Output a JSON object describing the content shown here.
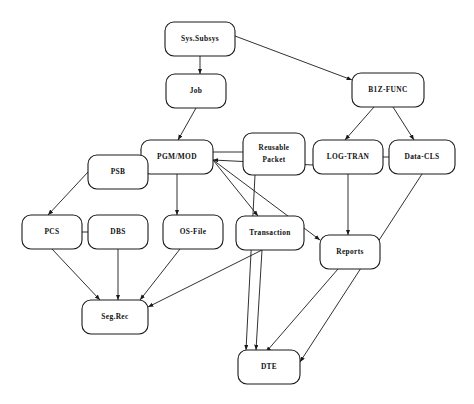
{
  "diagram": {
    "type": "node-link-flow",
    "background_color": "#ffffff",
    "stroke_color": "#1a1a1a",
    "nodes": [
      {
        "id": "sys_subsys",
        "label": "Sys.Subsys",
        "label_line1": "Sys.Subsys",
        "label_line2": "",
        "x": 165,
        "y": 22,
        "w": 70,
        "h": 34
      },
      {
        "id": "job",
        "label": "Job",
        "label_line1": "Job",
        "label_line2": "",
        "x": 166,
        "y": 74,
        "w": 60,
        "h": 34
      },
      {
        "id": "b1z_func",
        "label": "B1Z-FUNC",
        "label_line1": "B1Z-FUNC",
        "label_line2": "",
        "x": 352,
        "y": 73,
        "w": 72,
        "h": 34
      },
      {
        "id": "pgm_mod",
        "label": "PGM/MOD",
        "label_line1": "PGM/MOD",
        "label_line2": "",
        "x": 141,
        "y": 140,
        "w": 72,
        "h": 34
      },
      {
        "id": "reusable_packet",
        "label": "Reusable Packet",
        "label_line1": "Reusable",
        "label_line2": "Packet",
        "x": 243,
        "y": 133,
        "w": 62,
        "h": 42
      },
      {
        "id": "log_tran",
        "label": "LOG-TRAN",
        "label_line1": "LOG-TRAN",
        "label_line2": "",
        "x": 313,
        "y": 140,
        "w": 70,
        "h": 34
      },
      {
        "id": "data_cls",
        "label": "Data-CLS",
        "label_line1": "Data-CLS",
        "label_line2": "",
        "x": 389,
        "y": 140,
        "w": 66,
        "h": 34
      },
      {
        "id": "psb",
        "label": "PSB",
        "label_line1": "PSB",
        "label_line2": "",
        "x": 88,
        "y": 155,
        "w": 60,
        "h": 34
      },
      {
        "id": "pcs",
        "label": "PCS",
        "label_line1": "PCS",
        "label_line2": "",
        "x": 22,
        "y": 215,
        "w": 60,
        "h": 34
      },
      {
        "id": "dbs",
        "label": "DBS",
        "label_line1": "DBS",
        "label_line2": "",
        "x": 88,
        "y": 215,
        "w": 60,
        "h": 34
      },
      {
        "id": "os_file",
        "label": "OS-File",
        "label_line1": "OS-File",
        "label_line2": "",
        "x": 163,
        "y": 215,
        "w": 60,
        "h": 34
      },
      {
        "id": "transaction",
        "label": "Transaction",
        "label_line1": "Transaction",
        "label_line2": "",
        "x": 236,
        "y": 216,
        "w": 68,
        "h": 34
      },
      {
        "id": "reports",
        "label": "Reports",
        "label_line1": "Reports",
        "label_line2": "",
        "x": 320,
        "y": 235,
        "w": 60,
        "h": 34
      },
      {
        "id": "seg_rec",
        "label": "Seg.Rec",
        "label_line1": "Seg.Rec",
        "label_line2": "",
        "x": 82,
        "y": 300,
        "w": 66,
        "h": 34
      },
      {
        "id": "dte",
        "label": "DTE",
        "label_line1": "DTE",
        "label_line2": "",
        "x": 238,
        "y": 350,
        "w": 62,
        "h": 34
      }
    ],
    "edges": [
      {
        "from": "sys_subsys",
        "to": "job",
        "arrow": true,
        "x1": 200,
        "y1": 56,
        "x2": 200,
        "y2": 74
      },
      {
        "from": "sys_subsys",
        "to": "b1z_func",
        "arrow": true,
        "x1": 235,
        "y1": 36,
        "x2": 352,
        "y2": 80
      },
      {
        "from": "job",
        "to": "pgm_mod",
        "arrow": true,
        "x1": 196,
        "y1": 108,
        "x2": 178,
        "y2": 140
      },
      {
        "from": "b1z_func",
        "to": "log_tran",
        "arrow": true,
        "x1": 374,
        "y1": 107,
        "x2": 345,
        "y2": 140
      },
      {
        "from": "b1z_func",
        "to": "data_cls",
        "arrow": true,
        "x1": 393,
        "y1": 107,
        "x2": 414,
        "y2": 140
      },
      {
        "from": "pgm_mod",
        "to": "psb",
        "arrow": true,
        "x1": 141,
        "y1": 150,
        "x2": 148,
        "y2": 160
      },
      {
        "from": "psb",
        "to": "pcs",
        "arrow": true,
        "x1": 88,
        "y1": 172,
        "x2": 48,
        "y2": 215
      },
      {
        "from": "pcs",
        "to": "dbs",
        "arrow": false,
        "x1": 82,
        "y1": 232,
        "x2": 88,
        "y2": 232
      },
      {
        "from": "pgm_mod",
        "to": "os_file",
        "arrow": true,
        "x1": 177,
        "y1": 174,
        "x2": 177,
        "y2": 215
      },
      {
        "from": "pgm_mod",
        "to": "transaction",
        "arrow": true,
        "x1": 213,
        "y1": 160,
        "x2": 258,
        "y2": 216
      },
      {
        "from": "pgm_mod",
        "to": "reports",
        "arrow": true,
        "x1": 213,
        "y1": 160,
        "x2": 320,
        "y2": 240
      },
      {
        "from": "reusable_packet",
        "to": "pgm_mod",
        "arrow": false,
        "x1": 243,
        "y1": 152,
        "x2": 213,
        "y2": 152
      },
      {
        "from": "reusable_packet",
        "to": "dte",
        "arrow": true,
        "x1": 255,
        "y1": 175,
        "x2": 246,
        "y2": 350
      },
      {
        "from": "log_tran",
        "to": "pgm_mod",
        "arrow": true,
        "x1": 313,
        "y1": 165,
        "x2": 213,
        "y2": 160
      },
      {
        "from": "log_tran",
        "to": "data_cls",
        "arrow": false,
        "x1": 383,
        "y1": 157,
        "x2": 389,
        "y2": 157
      },
      {
        "from": "log_tran",
        "to": "reports",
        "arrow": true,
        "x1": 348,
        "y1": 174,
        "x2": 348,
        "y2": 235
      },
      {
        "from": "data_cls",
        "to": "dte",
        "arrow": true,
        "x1": 422,
        "y1": 174,
        "x2": 300,
        "y2": 362
      },
      {
        "from": "pcs",
        "to": "seg_rec",
        "arrow": true,
        "x1": 52,
        "y1": 249,
        "x2": 100,
        "y2": 300
      },
      {
        "from": "dbs",
        "to": "seg_rec",
        "arrow": true,
        "x1": 118,
        "y1": 249,
        "x2": 118,
        "y2": 300
      },
      {
        "from": "os_file",
        "to": "seg_rec",
        "arrow": true,
        "x1": 180,
        "y1": 249,
        "x2": 140,
        "y2": 300
      },
      {
        "from": "transaction",
        "to": "seg_rec",
        "arrow": true,
        "x1": 262,
        "y1": 250,
        "x2": 148,
        "y2": 307
      },
      {
        "from": "transaction",
        "to": "dte",
        "arrow": true,
        "x1": 262,
        "y1": 250,
        "x2": 256,
        "y2": 350
      },
      {
        "from": "reports",
        "to": "dte",
        "arrow": true,
        "x1": 338,
        "y1": 269,
        "x2": 266,
        "y2": 352
      }
    ]
  }
}
